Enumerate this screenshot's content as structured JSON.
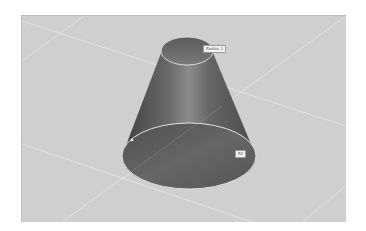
{
  "viewport": {
    "background_color": "#cfcfcf",
    "grid_color": "#e4e4e4",
    "object": "truncated-cone",
    "cone_color": "#5e5e5e",
    "cone_highlight_color": "#8a8a8a",
    "edge_color": "#d8d8d8"
  },
  "annotations": {
    "top_label": "Radius 1",
    "bottom_label": "R2"
  }
}
